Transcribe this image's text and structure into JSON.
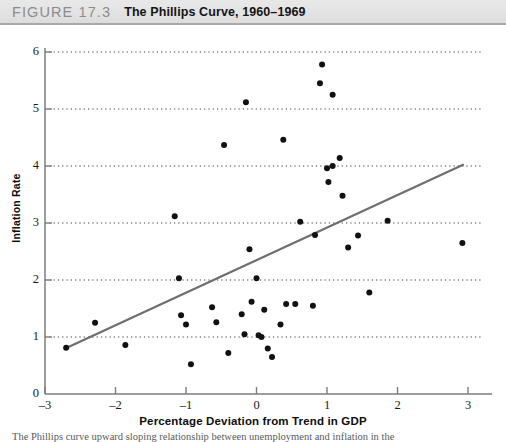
{
  "header": {
    "figure_number": "FIGURE 17.3",
    "figure_title": "The Phillips Curve, 1960–1969"
  },
  "caption": "The Phillips curve upward sloping relationship between unemployment and inflation in the",
  "chart_data": {
    "type": "scatter",
    "title": "The Phillips Curve, 1960–1969",
    "xlabel": "Percentage Deviation from Trend in GDP",
    "ylabel": "Inflation Rate",
    "xlim": [
      -3,
      3
    ],
    "ylim": [
      0,
      6
    ],
    "xticks": [
      -3,
      -2,
      -1,
      0,
      1,
      2,
      3
    ],
    "xtick_labels": [
      "–3",
      "–2",
      "–1",
      "0",
      "1",
      "2",
      "3"
    ],
    "yticks": [
      0,
      1,
      2,
      3,
      4,
      5,
      6
    ],
    "ytick_labels": [
      "0",
      "1",
      "2",
      "3",
      "4",
      "5",
      "6"
    ],
    "grid": "horizontal-dotted",
    "legend": "none",
    "marker_color": "#111111",
    "marker_size": 5.2,
    "trendline": {
      "label": "fitted Phillips curve",
      "color": "#6e6e6e",
      "width": 2.2,
      "x_start": -2.69,
      "y_start": 0.81,
      "x_end": 2.93,
      "y_end": 4.02
    },
    "points": [
      [
        -2.7,
        0.81
      ],
      [
        -2.29,
        1.25
      ],
      [
        -1.86,
        0.86
      ],
      [
        -1.16,
        3.12
      ],
      [
        -1.1,
        2.03
      ],
      [
        -1.07,
        1.38
      ],
      [
        -1.0,
        1.22
      ],
      [
        -0.93,
        0.52
      ],
      [
        -0.63,
        1.52
      ],
      [
        -0.57,
        1.26
      ],
      [
        -0.46,
        4.37
      ],
      [
        -0.4,
        0.72
      ],
      [
        -0.21,
        1.4
      ],
      [
        -0.17,
        1.05
      ],
      [
        -0.15,
        5.12
      ],
      [
        -0.1,
        2.54
      ],
      [
        -0.07,
        1.62
      ],
      [
        0.0,
        2.03
      ],
      [
        0.03,
        1.03
      ],
      [
        0.07,
        1.0
      ],
      [
        0.11,
        1.48
      ],
      [
        0.16,
        0.8
      ],
      [
        0.22,
        0.65
      ],
      [
        0.34,
        1.22
      ],
      [
        0.38,
        4.46
      ],
      [
        0.42,
        1.58
      ],
      [
        0.55,
        1.58
      ],
      [
        0.62,
        3.02
      ],
      [
        0.8,
        1.55
      ],
      [
        0.83,
        2.79
      ],
      [
        0.93,
        5.78
      ],
      [
        0.9,
        5.45
      ],
      [
        1.08,
        5.25
      ],
      [
        1.0,
        3.96
      ],
      [
        1.08,
        4.0
      ],
      [
        1.18,
        4.14
      ],
      [
        1.02,
        3.72
      ],
      [
        1.22,
        3.48
      ],
      [
        1.3,
        2.57
      ],
      [
        1.44,
        2.78
      ],
      [
        1.6,
        1.78
      ],
      [
        1.86,
        3.04
      ],
      [
        2.92,
        2.65
      ]
    ]
  }
}
